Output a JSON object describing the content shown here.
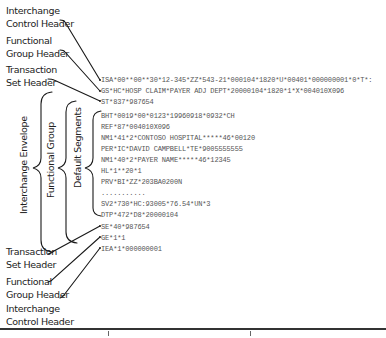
{
  "top_labels": [
    {
      "line1": "Interchange",
      "line2": "Control Header"
    },
    {
      "line1": "Functional",
      "line2": "Group Header"
    },
    {
      "line1": "Transaction",
      "line2": "Set Header"
    }
  ],
  "bottom_labels": [
    {
      "line1": "Transaction",
      "line2": "Set Header"
    },
    {
      "line1": "Functional",
      "line2": "Group Header"
    },
    {
      "line1": "Interchange",
      "line2": "Control Header"
    }
  ],
  "brackets": [
    {
      "label": "Interchange Envelope"
    },
    {
      "label": "Functional Group"
    },
    {
      "label": "Default Segments"
    }
  ],
  "segments": [
    "ISA*00**00**30*12-345*ZZ*543-21*000104*1820*U*00401*000000001*0*T*:",
    "GS*HC*HOSP CLAIM*PAYER ADJ DEPT*20000104*1820*1*X*004010X096",
    "ST*837*987654",
    "BHT*0019*00*0123*19960918*0932*CH",
    "REF*87*004010X096",
    "NM1*41*2*CONTOSO HOSPITAL*****46*00120",
    "PER*IC*DAVID CAMPBELL*TE*9005555555",
    "NM1*40*2*PAYER NAME*****46*12345",
    "HL*1**20*1",
    "PRV*BI*ZZ*203BA0200N",
    "...........",
    "SV2*730*HC:93005*76.54*UN*3",
    "DTP*472*D8*20000104",
    "SE*40*987654",
    "GE*1*1",
    "IEA*1*000000001"
  ]
}
